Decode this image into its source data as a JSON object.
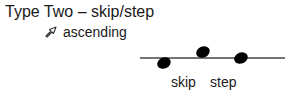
{
  "diagram": {
    "title": "Type Two – skip/step",
    "direction": {
      "icon": "hollow-arrow-up-right-icon",
      "label": "ascending"
    },
    "staff": {
      "line": {
        "x1": 140,
        "x2": 285,
        "y": 58,
        "color": "#444444"
      },
      "notes": [
        {
          "cx": 164,
          "cy": 63,
          "position": "below line"
        },
        {
          "cx": 203,
          "cy": 52,
          "position": "above line"
        },
        {
          "cx": 241,
          "cy": 58,
          "position": "on line"
        }
      ],
      "note_color": "#000000"
    },
    "labels": [
      {
        "text": "skip",
        "x": 171
      },
      {
        "text": "step",
        "x": 210
      }
    ]
  }
}
